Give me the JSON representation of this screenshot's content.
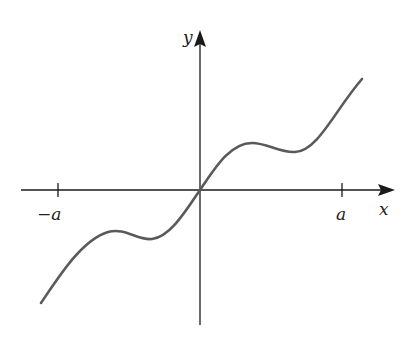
{
  "diagram": {
    "type": "function-graph",
    "axes": {
      "x_label": "x",
      "y_label": "y"
    },
    "ticks": [
      {
        "label": "−a",
        "position": "-a"
      },
      {
        "label": "a",
        "position": "a"
      }
    ],
    "colors": {
      "axis": "#1a1a1a",
      "curve": "#5a5a5a",
      "background": "#ffffff"
    }
  }
}
